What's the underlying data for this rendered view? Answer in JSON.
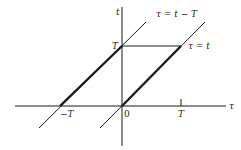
{
  "diagram": {
    "axes": {
      "horizontal_label": "τ",
      "vertical_label": "t"
    },
    "tick_labels": {
      "origin": "0",
      "neg_T": "−T",
      "pos_T": "T",
      "t_T": "T"
    },
    "lines": [
      {
        "name": "upper-line",
        "equation": "τ = t − T"
      },
      {
        "name": "lower-line",
        "equation": "τ = t"
      }
    ],
    "colors": {
      "stroke": "#1a1a1a",
      "background": "#ffffff"
    }
  }
}
